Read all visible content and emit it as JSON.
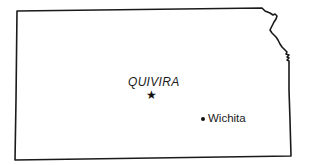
{
  "map": {
    "region": "Kansas",
    "outline_color": "#1a1a1a",
    "background_color": "#ffffff"
  },
  "labels": {
    "quivira": "QUIVIRA",
    "wichita": "Wichita"
  },
  "markers": [
    {
      "name": "Quivira",
      "symbol": "star",
      "glyph": "★"
    },
    {
      "name": "Wichita",
      "symbol": "dot"
    }
  ]
}
